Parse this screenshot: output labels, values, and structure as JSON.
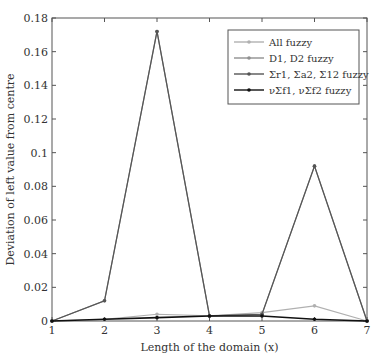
{
  "chart_data": {
    "type": "line",
    "title": "",
    "xlabel": "Length of the domain (x)",
    "ylabel": "Deviation of left value from centre",
    "x": [
      1,
      2,
      3,
      4,
      5,
      6,
      7
    ],
    "xlim": [
      1,
      7
    ],
    "ylim": [
      0,
      0.18
    ],
    "yticks": [
      "0",
      "0.02",
      "0.04",
      "0.06",
      "0.08",
      "0.1",
      "0.12",
      "0.14",
      "0.16",
      "0.18"
    ],
    "xticks": [
      "1",
      "2",
      "3",
      "4",
      "5",
      "6",
      "7"
    ],
    "grid": false,
    "legend_position": "upper right",
    "series": [
      {
        "name": "All fuzzy",
        "color": "#b0b0b0",
        "values": [
          0,
          0.001,
          0.004,
          0.003,
          0.005,
          0.009,
          0
        ]
      },
      {
        "name": "D1, D2 fuzzy",
        "color": "#909090",
        "values": [
          0,
          0.012,
          0.172,
          0.003,
          0.004,
          0.092,
          0
        ]
      },
      {
        "name": "Σr1, Σa2, Σ12 fuzzy",
        "color": "#555555",
        "values": [
          0,
          0.012,
          0.172,
          0.003,
          0.004,
          0.092,
          0
        ]
      },
      {
        "name": "νΣf1, νΣf2 fuzzy",
        "color": "#111111",
        "values": [
          0,
          0.001,
          0.002,
          0.003,
          0.003,
          0.001,
          0
        ]
      }
    ]
  }
}
